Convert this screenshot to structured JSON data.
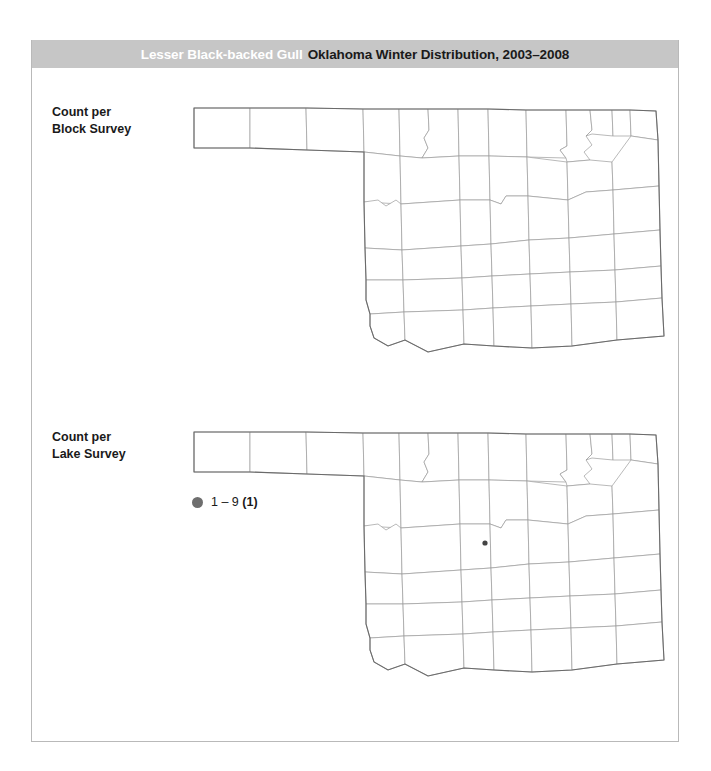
{
  "header": {
    "species": "Lesser Black-backed Gull",
    "title": "Oklahoma Winter Distribution, 2003–2008",
    "banner_color": "#c6c6c6",
    "species_color": "#ffffff",
    "title_color": "#1a1a1a"
  },
  "panels": [
    {
      "id": "block-survey",
      "label_line1": "Count per",
      "label_line2": "Block Survey",
      "points": []
    },
    {
      "id": "lake-survey",
      "label_line1": "Count per",
      "label_line2": "Lake Survey",
      "points": [
        {
          "x": 485,
          "y": 543,
          "radius": 2.6,
          "color": "#444444",
          "class": "1 – 9"
        }
      ]
    }
  ],
  "legend": {
    "swatch_color": "#6e6e6e",
    "range_label": "1 – 9",
    "count_label": "(1)",
    "full_label": "1 – 9 (1)"
  },
  "chart_data": {
    "type": "map",
    "title": "Oklahoma Winter Distribution, 2003–2008",
    "subject": "Lesser Black-backed Gull",
    "region": "Oklahoma",
    "period": "2003–2008",
    "season": "Winter",
    "panels": [
      {
        "name": "Count per Block Survey",
        "records": 0,
        "values": []
      },
      {
        "name": "Count per Lake Survey",
        "records": 1,
        "values": [
          {
            "bin": "1 – 9",
            "count": 1,
            "location_norm_x": 0.621,
            "location_norm_y": 0.455
          }
        ]
      }
    ],
    "legend_bins": [
      {
        "label": "1 – 9",
        "records": 1,
        "color": "#6e6e6e"
      }
    ],
    "grid": false,
    "legend_position": "left"
  },
  "frame": {
    "border_color": "#b9b9b9",
    "background": "#ffffff"
  }
}
